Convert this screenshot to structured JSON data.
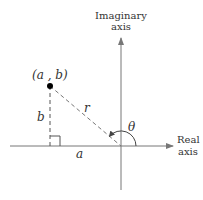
{
  "axes": {
    "imaginary_label_line1": "Imaginary",
    "imaginary_label_line2": "axis",
    "real_label_line1": "Real",
    "real_label_line2": "axis"
  },
  "point": {
    "label": "(a , b)"
  },
  "labels": {
    "vertical_leg": "b",
    "horizontal_leg": "a",
    "hypotenuse": "r",
    "angle": "θ"
  },
  "colors": {
    "line": "#777777",
    "text": "#333333",
    "point": "#000000"
  }
}
